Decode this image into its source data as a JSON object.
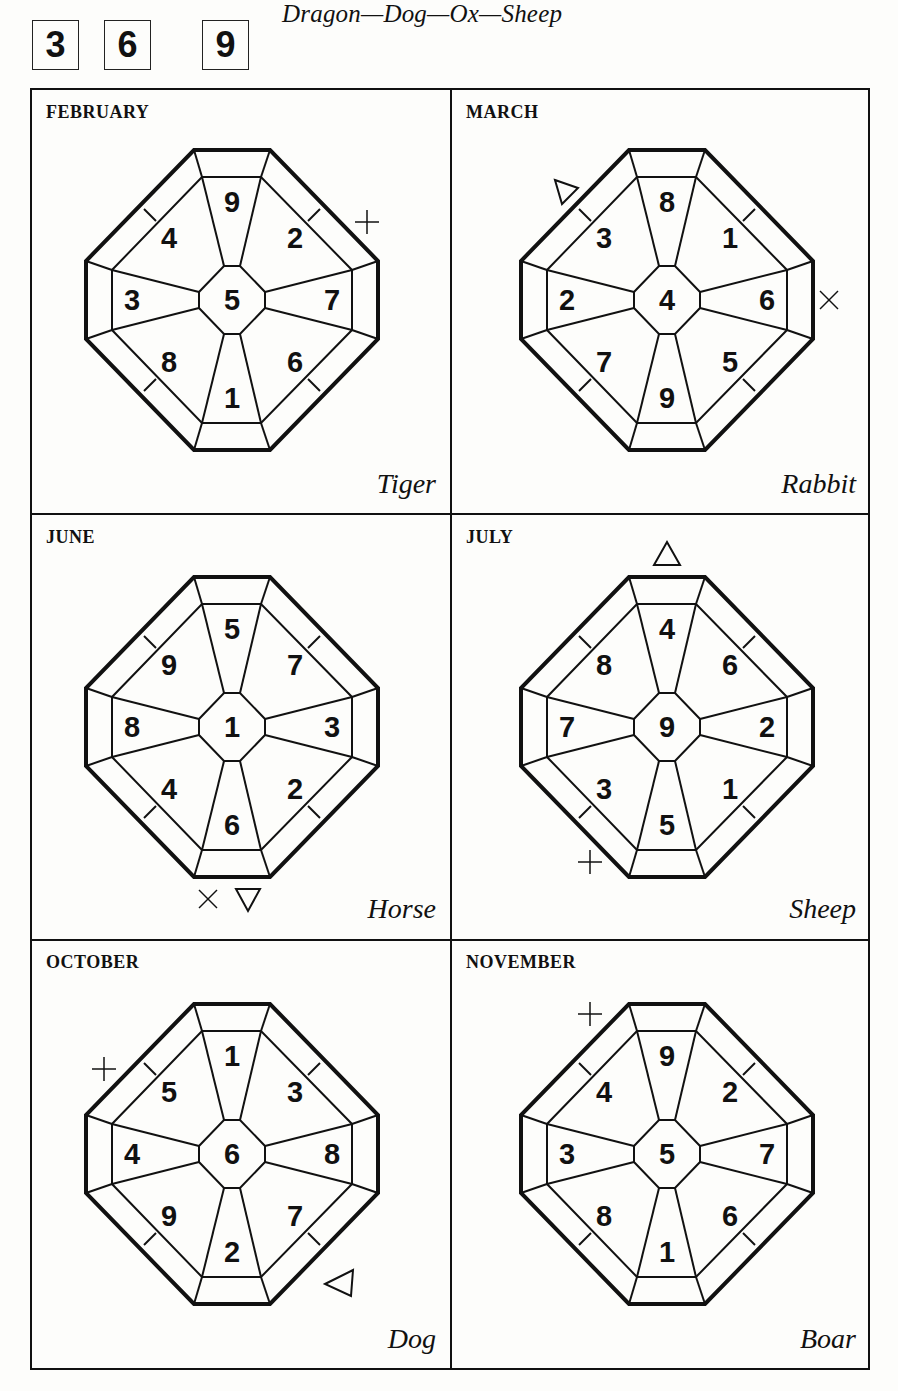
{
  "header": {
    "period_numbers": [
      "3",
      "6",
      "9"
    ],
    "title": "Dragon—Dog—Ox—Sheep"
  },
  "panels": [
    {
      "month": "FEBRUARY",
      "animal": "Tiger",
      "grid": {
        "center": "5",
        "n": "9",
        "ne": "2",
        "e": "7",
        "se": "6",
        "s": "1",
        "sw": "8",
        "w": "3",
        "nw": "4"
      },
      "markers": [
        {
          "symbol": "cross",
          "glyph": "+",
          "position": "upper-right"
        }
      ]
    },
    {
      "month": "MARCH",
      "animal": "Rabbit",
      "grid": {
        "center": "4",
        "n": "8",
        "ne": "1",
        "e": "6",
        "se": "5",
        "s": "9",
        "sw": "7",
        "w": "2",
        "nw": "3"
      },
      "markers": [
        {
          "symbol": "triangle",
          "glyph": "△",
          "position": "upper-left"
        },
        {
          "symbol": "x-mark",
          "glyph": "×",
          "position": "right"
        }
      ]
    },
    {
      "month": "JUNE",
      "animal": "Horse",
      "grid": {
        "center": "1",
        "n": "5",
        "ne": "7",
        "e": "3",
        "se": "2",
        "s": "6",
        "sw": "4",
        "w": "8",
        "nw": "9"
      },
      "markers": [
        {
          "symbol": "x-mark",
          "glyph": "×",
          "position": "bottom"
        },
        {
          "symbol": "triangle-down",
          "glyph": "▽",
          "position": "bottom"
        }
      ]
    },
    {
      "month": "JULY",
      "animal": "Sheep",
      "grid": {
        "center": "9",
        "n": "4",
        "ne": "6",
        "e": "2",
        "se": "1",
        "s": "5",
        "sw": "3",
        "w": "7",
        "nw": "8"
      },
      "markers": [
        {
          "symbol": "triangle",
          "glyph": "△",
          "position": "top"
        },
        {
          "symbol": "cross",
          "glyph": "+",
          "position": "lower-left"
        }
      ]
    },
    {
      "month": "OCTOBER",
      "animal": "Dog",
      "grid": {
        "center": "6",
        "n": "1",
        "ne": "3",
        "e": "8",
        "se": "7",
        "s": "2",
        "sw": "9",
        "w": "4",
        "nw": "5"
      },
      "markers": [
        {
          "symbol": "cross",
          "glyph": "+",
          "position": "upper-left"
        },
        {
          "symbol": "triangle",
          "glyph": "◁",
          "position": "lower-right"
        }
      ]
    },
    {
      "month": "NOVEMBER",
      "animal": "Boar",
      "grid": {
        "center": "5",
        "n": "9",
        "ne": "2",
        "e": "7",
        "se": "6",
        "s": "1",
        "sw": "8",
        "w": "3",
        "nw": "4"
      },
      "markers": [
        {
          "symbol": "cross",
          "glyph": "+",
          "position": "upper-left"
        }
      ]
    }
  ]
}
